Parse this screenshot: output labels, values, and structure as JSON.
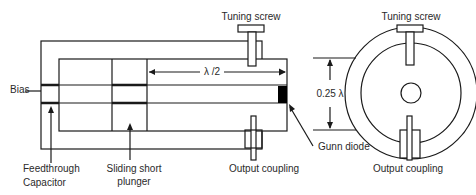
{
  "figure": {
    "colors": {
      "line": "#1a1a1a",
      "text": "#2a2a2a",
      "background": "#ffffff",
      "diode": "#000000"
    }
  },
  "labels": {
    "tuning_screw_side": "Tuning screw",
    "tuning_screw_end": "Tuning screw",
    "bias": "Bias",
    "half_wavelength": "λ /2",
    "quarter_wavelength": "0.25 λ",
    "feedthrough_line1": "Feedthrough",
    "feedthrough_line2": "Capacitor",
    "plunger_line1": "Sliding short",
    "plunger_line2": "plunger",
    "output_coupling_side": "Output coupling",
    "gunn_diode": "Gunn diode",
    "output_coupling_end": "Output coupling"
  }
}
